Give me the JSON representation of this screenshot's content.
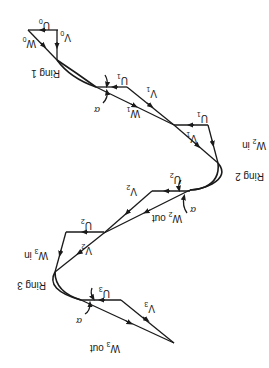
{
  "diagram": {
    "orientation": "rotated 180 degrees",
    "rings": [
      {
        "label": "Ring 1"
      },
      {
        "label": "Ring 2"
      },
      {
        "label": "Ring 3"
      }
    ],
    "vectors": {
      "U0": {
        "base": "U",
        "sub": "0"
      },
      "V0": {
        "base": "V",
        "sub": "0"
      },
      "W0": {
        "base": "W",
        "sub": "0"
      },
      "U1a": {
        "base": "U",
        "sub": "1"
      },
      "V1a": {
        "base": "V",
        "sub": "1"
      },
      "W1": {
        "base": "W",
        "sub": "1"
      },
      "U1b": {
        "base": "U",
        "sub": "1"
      },
      "V1b": {
        "base": "V",
        "sub": "1"
      },
      "W2in": {
        "base": "W",
        "sub": "2",
        "suffix": " in"
      },
      "U2a": {
        "base": "U",
        "sub": "2"
      },
      "V2a": {
        "base": "V",
        "sub": "2"
      },
      "W2out": {
        "base": "W",
        "sub": "2",
        "suffix": " out"
      },
      "U2b": {
        "base": "U",
        "sub": "2"
      },
      "V2b": {
        "base": "V",
        "sub": "2"
      },
      "W3in": {
        "base": "W",
        "sub": "3",
        "suffix": " in"
      },
      "U3": {
        "base": "U",
        "sub": "3"
      },
      "V3": {
        "base": "V",
        "sub": "3"
      },
      "W3out": {
        "base": "W",
        "sub": "3",
        "suffix": " out"
      }
    },
    "angle_symbol": "α"
  }
}
